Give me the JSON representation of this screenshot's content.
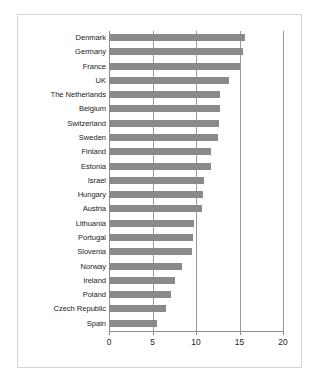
{
  "chart_data": {
    "type": "bar",
    "orientation": "horizontal",
    "title": "",
    "xlabel": "",
    "ylabel": "",
    "xlim": [
      0,
      20
    ],
    "xticks": [
      0,
      5,
      10,
      15,
      20
    ],
    "xtick_labels": [
      "0",
      "5",
      "10",
      "15",
      "20"
    ],
    "grid": true,
    "gridlines_at": [
      5,
      10,
      15,
      20
    ],
    "legend": "none",
    "bar_color": "#8a8a8a",
    "background_color": "#ffffff",
    "frame_color": "#d4d4d4",
    "axis_color": "#8f8f8f",
    "categories": [
      "Denmark",
      "Germany",
      "France",
      "UK",
      "The Netherlands",
      "Belgium",
      "Switzerland",
      "Sweden",
      "Finland",
      "Estonia",
      "Israel",
      "Hungary",
      "Austria",
      "Lithuania",
      "Portugal",
      "Slovenia",
      "Norway",
      "Ireland",
      "Poland",
      "Czech Republic",
      "Spain"
    ],
    "values": [
      15.6,
      15.4,
      15.1,
      13.8,
      12.8,
      12.8,
      12.7,
      12.5,
      11.7,
      11.7,
      10.9,
      10.8,
      10.7,
      9.8,
      9.6,
      9.5,
      8.4,
      7.6,
      7.1,
      6.6,
      5.5
    ]
  }
}
